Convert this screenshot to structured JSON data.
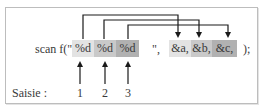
{
  "diagram": {
    "prefix": "scan f(\"",
    "format_specifiers": [
      {
        "label": "%d",
        "fill": "#e3e3e3"
      },
      {
        "label": "%d",
        "fill": "#c9c9c9"
      },
      {
        "label": "%d",
        "fill": "#b1b1b1"
      }
    ],
    "format_close": "\",",
    "arguments": [
      {
        "label": "&a,",
        "fill": "#e3e3e3"
      },
      {
        "label": "&b,",
        "fill": "#c9c9c9"
      },
      {
        "label": "&c,",
        "fill": "#b1b1b1"
      }
    ],
    "suffix": ");",
    "input_label": "Saisie :",
    "input_values": [
      "1",
      "2",
      "3"
    ],
    "line_color": "#1a1a1a",
    "frame_color": "#bdbdbd"
  }
}
